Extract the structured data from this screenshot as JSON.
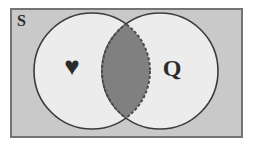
{
  "figure": {
    "name": "venn-diagram",
    "type": "two-set-venn",
    "caption_label": "S"
  },
  "universe": {
    "label": "S",
    "fill_color": "#c9c9c9",
    "border_color": "#747474"
  },
  "sets": [
    {
      "id": "left",
      "label": "♥",
      "icon_name": "heart-symbol",
      "fill_color": "#ececec",
      "stroke_color": "#3a3a3a",
      "center_x": 92,
      "center_y": 71,
      "radius": 58
    },
    {
      "id": "right",
      "label": "Q",
      "icon_name": "letter-q",
      "fill_color": "#ececec",
      "stroke_color": "#3a3a3a",
      "center_x": 160,
      "center_y": 71,
      "radius": 58
    }
  ],
  "intersection": {
    "name": "intersection-lens",
    "fill_color": "#808080",
    "stroke_color": "#4a4a4a",
    "stroke_style": "dashed",
    "shaded": true
  }
}
